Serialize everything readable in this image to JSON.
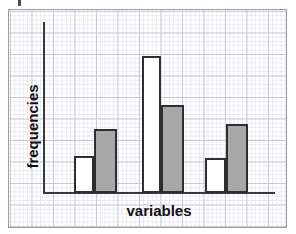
{
  "figure": {
    "name": "paired-bar-chart-on-graph-paper",
    "background_color": "#ffffff",
    "frame_color": "#9a9aa2",
    "grid_minor_color": "#e9e9f0",
    "grid_major_color": "#c9c9d6",
    "axis_color": "#3a3a3a",
    "stray_mark": "ink-mark"
  },
  "chart_data": {
    "type": "bar",
    "title": "",
    "subtitle": "",
    "xlabel": "variables",
    "ylabel": "frequencies",
    "categories": [
      "group 1",
      "group 2",
      "group 3"
    ],
    "series": [
      {
        "name": "white bars",
        "fill_color": "#ffffff",
        "outline_color": "#2e2e2e",
        "values": [
          8.5,
          31.8,
          8.1
        ]
      },
      {
        "name": "grey bars",
        "fill_color": "#a8a8a8",
        "outline_color": "#2e2e2e",
        "values": [
          14.9,
          20.4,
          16.0
        ]
      }
    ],
    "ylim": [
      0,
      39.8
    ],
    "xlim": [
      0,
      53.9
    ],
    "grid": true,
    "legend": "none",
    "axis_tick_labels_x": [],
    "axis_tick_labels_y": [],
    "annotations": [],
    "bars_px": [
      {
        "series": "white bars",
        "category": "group 1",
        "x": 74,
        "width": 20,
        "top": 156,
        "baseline": 193
      },
      {
        "series": "grey bars",
        "category": "group 1",
        "x": 94,
        "width": 23,
        "top": 129,
        "baseline": 193
      },
      {
        "series": "white bars",
        "category": "group 2",
        "x": 142,
        "width": 19,
        "top": 56,
        "baseline": 193
      },
      {
        "series": "grey bars",
        "category": "group 2",
        "x": 161,
        "width": 23,
        "top": 105,
        "baseline": 193
      },
      {
        "series": "white bars",
        "category": "group 3",
        "x": 205,
        "width": 21,
        "top": 158,
        "baseline": 193
      },
      {
        "series": "grey bars",
        "category": "group 3",
        "x": 226,
        "width": 22,
        "top": 124,
        "baseline": 193
      }
    ]
  }
}
